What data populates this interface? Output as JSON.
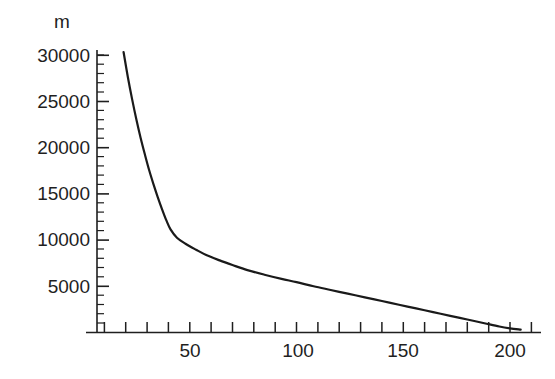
{
  "chart_data": {
    "type": "line",
    "title": "",
    "subtitle": "",
    "xlabel": "",
    "ylabel": "m",
    "ylabel_unit": "m",
    "xlim": [
      0,
      212
    ],
    "ylim": [
      0,
      31500
    ],
    "grid": false,
    "legend": false,
    "legend_position": "none",
    "x_ticks_major": [
      50,
      100,
      150,
      200
    ],
    "x_tick_labels": [
      "50",
      "100",
      "150",
      "200"
    ],
    "x_tick_minor_step": 10,
    "y_ticks_major": [
      5000,
      10000,
      15000,
      20000,
      25000,
      30000
    ],
    "y_tick_labels": [
      "5000",
      "10000",
      "15000",
      "20000",
      "25000",
      "30000"
    ],
    "y_tick_minor_step": 1000,
    "series": [
      {
        "name": "curve",
        "color": "#1a1a1a",
        "line_width": 2.2,
        "x": [
          19,
          21,
          23,
          25,
          27,
          29,
          31,
          33,
          35,
          37,
          39,
          41,
          44,
          48,
          53,
          58,
          64,
          70,
          77,
          85,
          93,
          100,
          108,
          116,
          124,
          132,
          140,
          148,
          156,
          164,
          172,
          180,
          188,
          195,
          200,
          205
        ],
        "y": [
          30300,
          27600,
          25200,
          23000,
          21000,
          19200,
          17500,
          16000,
          14600,
          13300,
          12100,
          11100,
          10200,
          9550,
          8900,
          8300,
          7750,
          7250,
          6700,
          6200,
          5750,
          5400,
          4950,
          4550,
          4150,
          3750,
          3350,
          2950,
          2550,
          2150,
          1750,
          1350,
          950,
          600,
          400,
          250
        ]
      }
    ],
    "axis_color": "#1f1f1f",
    "background": "#ffffff"
  },
  "axes": {
    "y_axis_label": "m",
    "x_axis_label": ""
  },
  "geometry": {
    "plot_left": 97,
    "plot_baseline": 332,
    "plot_right": 540,
    "plot_top": 50,
    "x_origin_px": 83,
    "x_px_per_unit": 2.135,
    "y_px_per_5000": 46.2
  }
}
